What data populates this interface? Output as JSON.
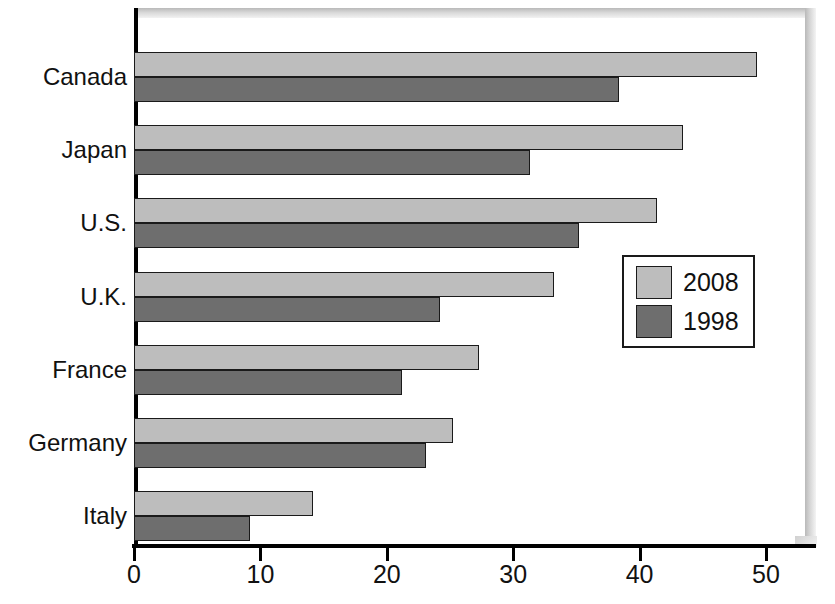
{
  "chart_data": {
    "type": "bar",
    "orientation": "horizontal",
    "title": "",
    "subtitle": "",
    "xlabel": "",
    "ylabel": "",
    "xlim": [
      0,
      54
    ],
    "ylim": null,
    "grid": false,
    "legend_position": "inside-right",
    "categories": [
      "Canada",
      "Japan",
      "U.S.",
      "U.K.",
      "France",
      "Germany",
      "Italy"
    ],
    "tick_values": [
      0,
      10,
      20,
      30,
      40,
      50
    ],
    "tick_labels": [
      "0",
      "10",
      "20",
      "30",
      "40",
      "50"
    ],
    "series": [
      {
        "name": "2008",
        "color": "#bdbdbd",
        "values": [
          49.3,
          43.4,
          41.4,
          33.2,
          27.3,
          25.2,
          14.2
        ]
      },
      {
        "name": "1998",
        "color": "#6e6e6e",
        "values": [
          38.4,
          31.3,
          35.2,
          24.2,
          21.2,
          23.1,
          9.2
        ]
      }
    ]
  },
  "legend": {
    "entries": [
      {
        "label": "2008",
        "color": "#bdbdbd"
      },
      {
        "label": "1998",
        "color": "#6e6e6e"
      }
    ]
  },
  "colors": {
    "series_2008": "#bdbdbd",
    "series_1998": "#6e6e6e",
    "axis": "#000000",
    "text": "#111111",
    "background": "#ffffff",
    "frame": "#d0d0d0"
  }
}
